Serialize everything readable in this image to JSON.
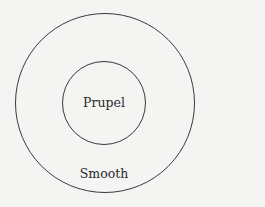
{
  "diagram": {
    "type": "nested-circles",
    "background": "#f4f4f3",
    "stroke_color": "#3a3a3a",
    "outer_circle": {
      "label": "Smooth",
      "cx": 105,
      "cy": 103,
      "r": 90
    },
    "inner_circle": {
      "label": "Prupel",
      "cx": 104,
      "cy": 103,
      "r": 42
    }
  }
}
